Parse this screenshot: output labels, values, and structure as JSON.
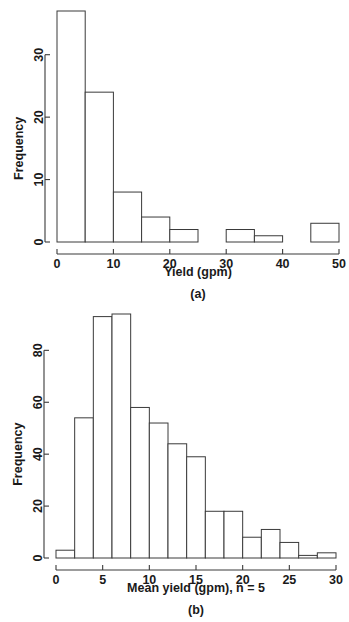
{
  "figure": {
    "panels": [
      {
        "id": "a",
        "caption": "(a)"
      },
      {
        "id": "b",
        "caption": "(b)"
      }
    ]
  },
  "chart_data": [
    {
      "type": "bar",
      "subtype": "histogram",
      "panel": "(a)",
      "title": "",
      "xlabel": "Yield (gpm)",
      "ylabel": "Frequency",
      "xlim": [
        0,
        50
      ],
      "ylim": [
        0,
        37
      ],
      "bin_width": 5,
      "grid": false,
      "legend": null,
      "xticks": [
        0,
        10,
        20,
        30,
        40,
        50
      ],
      "xtick_labels": [
        "0",
        "10",
        "20",
        "30",
        "40",
        "50"
      ],
      "yticks": [
        0,
        10,
        20,
        30
      ],
      "ytick_labels": [
        "0",
        "10",
        "20",
        "30"
      ],
      "bin_edges": [
        0,
        5,
        10,
        15,
        20,
        25,
        30,
        35,
        40,
        45,
        50
      ],
      "categories": [
        "0-5",
        "5-10",
        "10-15",
        "15-20",
        "20-25",
        "25-30",
        "30-35",
        "35-40",
        "40-45",
        "45-50"
      ],
      "values": [
        37,
        24,
        8,
        4,
        2,
        0,
        2,
        1,
        0,
        3
      ]
    },
    {
      "type": "bar",
      "subtype": "histogram",
      "panel": "(b)",
      "title": "",
      "xlabel": "Mean yield (gpm), n = 5",
      "ylabel": "Frequency",
      "xlim": [
        0,
        30
      ],
      "ylim": [
        0,
        94
      ],
      "bin_width": 2,
      "grid": false,
      "legend": null,
      "xticks": [
        0,
        5,
        10,
        15,
        20,
        25,
        30
      ],
      "xtick_labels": [
        "0",
        "5",
        "10",
        "15",
        "20",
        "25",
        "30"
      ],
      "yticks": [
        0,
        20,
        40,
        60,
        80
      ],
      "ytick_labels": [
        "0",
        "20",
        "40",
        "60",
        "80"
      ],
      "bin_edges": [
        0,
        2,
        4,
        6,
        8,
        10,
        12,
        14,
        16,
        18,
        20,
        22,
        24,
        26,
        28,
        30
      ],
      "categories": [
        "0-2",
        "2-4",
        "4-6",
        "6-8",
        "8-10",
        "10-12",
        "12-14",
        "14-16",
        "16-18",
        "18-20",
        "20-22",
        "22-24",
        "24-26",
        "26-28",
        "28-30"
      ],
      "values": [
        3,
        54,
        93,
        94,
        58,
        52,
        44,
        39,
        18,
        18,
        8,
        11,
        6,
        1,
        2
      ]
    }
  ],
  "colors": {
    "axis": "#3a3a3a",
    "bar_stroke": "#3a3a3a",
    "bar_fill": "#ffffff",
    "text": "#1a1a1a",
    "background": "#ffffff"
  }
}
